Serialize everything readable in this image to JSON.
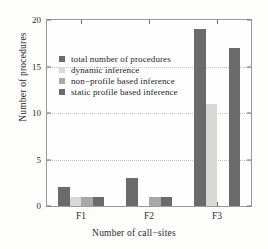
{
  "chart_data": {
    "type": "bar",
    "title": "",
    "xlabel": "Number of call−sites",
    "ylabel": "Number of procedures",
    "categories": [
      "F1",
      "F2",
      "F3"
    ],
    "ylim": [
      0,
      20
    ],
    "yticks": [
      0,
      5,
      10,
      15,
      20
    ],
    "grid": true,
    "legend_position": "upper left",
    "series": [
      {
        "name": "total number of procedures",
        "color": "#6b6b6b",
        "values": [
          2,
          3,
          19
        ]
      },
      {
        "name": "dynamic inference",
        "color": "#d8d8d6",
        "values": [
          1,
          0,
          11
        ]
      },
      {
        "name": "non−profile based inference",
        "color": "#a8a8a6",
        "values": [
          1,
          1,
          0
        ]
      },
      {
        "name": "static profile based inference",
        "color": "#6b6b6b",
        "values": [
          1,
          1,
          17
        ]
      }
    ]
  }
}
